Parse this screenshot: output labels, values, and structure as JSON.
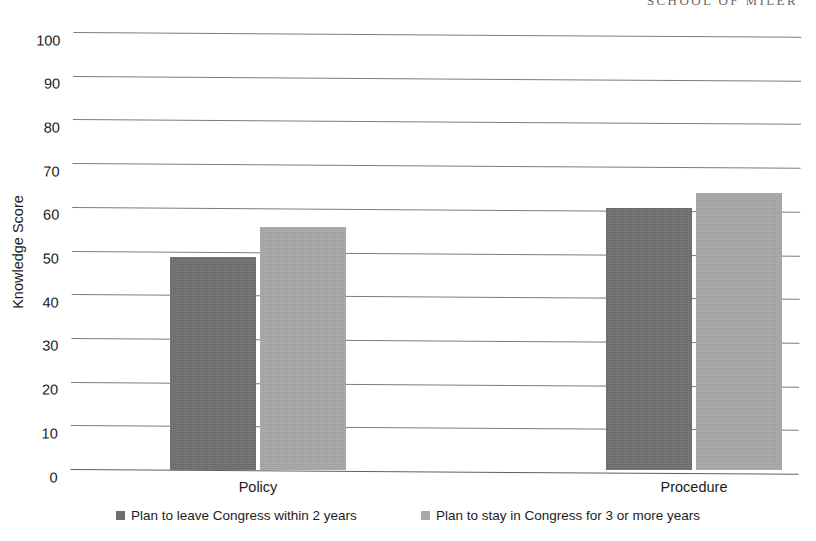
{
  "page": {
    "running_header": "SCHOOL OF MILER"
  },
  "chart_data": {
    "type": "bar",
    "title": "",
    "subtitle": "",
    "xlabel": "",
    "ylabel": "Knowledge Score",
    "ylim": [
      0,
      100
    ],
    "ytick_step": 10,
    "yticks": [
      0,
      10,
      20,
      30,
      40,
      50,
      60,
      70,
      80,
      90,
      100
    ],
    "ytick_labels": [
      "0",
      "10",
      "20",
      "30",
      "40",
      "50",
      "60",
      "70",
      "80",
      "90",
      "100"
    ],
    "grid": true,
    "grid_axis": "y",
    "legend_position": "bottom",
    "categories": [
      "Policy",
      "Procedure"
    ],
    "series": [
      {
        "name": "Plan to leave Congress within 2 years",
        "color": "#6e6e6e",
        "values": [
          48.8,
          60.0
        ]
      },
      {
        "name": "Plan to stay in Congress for 3 or more years",
        "color": "#a9a9a9",
        "values": [
          55.5,
          63.5
        ]
      }
    ]
  }
}
